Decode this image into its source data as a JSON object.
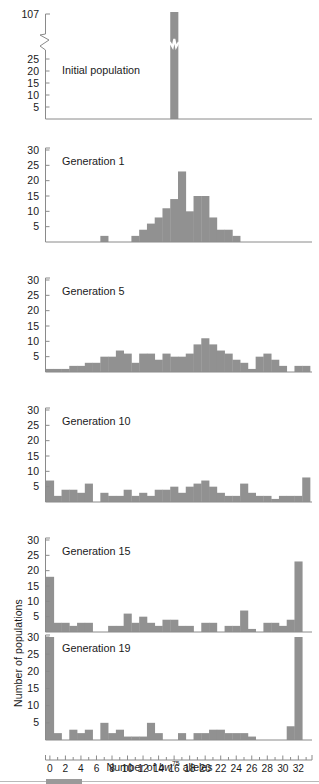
{
  "figure": {
    "y_axis_title": "Number of populations",
    "x_axis_title_parts": {
      "pre": "Number of ",
      "gene": "bw",
      "sup": "75",
      "post": " alleles"
    },
    "x_axis_title_plain": "Number of bw75 alleles",
    "bar_color": "#919191",
    "axis_color": "#8a8a8a",
    "text_color": "#1a1a1a",
    "x_tick_labels": [
      "0",
      "2",
      "4",
      "6",
      "8",
      "10",
      "12",
      "14",
      "16",
      "18",
      "20",
      "22",
      "24",
      "26",
      "28",
      "30",
      "32"
    ],
    "x_tick_values": [
      0,
      2,
      4,
      6,
      8,
      10,
      12,
      14,
      16,
      18,
      20,
      22,
      24,
      26,
      28,
      30,
      32
    ],
    "x_minor_ticks": [
      1,
      3,
      5,
      7,
      9,
      11,
      13,
      15,
      17,
      19,
      21,
      23,
      25,
      27,
      29,
      31,
      33
    ],
    "x_range": [
      0,
      33
    ]
  },
  "scrollbar": {
    "name": "horizontal-scrollbar"
  },
  "chart_data": [
    {
      "type": "bar",
      "panel_index": 0,
      "title": "Initial population",
      "xlabel": "",
      "ylabel": "",
      "ylim": [
        0,
        30
      ],
      "y_ticks": [
        5,
        10,
        15,
        20,
        25
      ],
      "y_tick_labels": [
        "5",
        "10",
        "15",
        "20",
        "25"
      ],
      "broken_axis": true,
      "broken_axis_top_label": "107",
      "broken_axis_top_value": 107,
      "grid": false,
      "categories": [
        0,
        1,
        2,
        3,
        4,
        5,
        6,
        7,
        8,
        9,
        10,
        11,
        12,
        13,
        14,
        15,
        16,
        17,
        18,
        19,
        20,
        21,
        22,
        23,
        24,
        25,
        26,
        27,
        28,
        29,
        30,
        31,
        32,
        33
      ],
      "values": [
        0,
        0,
        0,
        0,
        0,
        0,
        0,
        0,
        0,
        0,
        0,
        0,
        0,
        0,
        0,
        0,
        107,
        0,
        0,
        0,
        0,
        0,
        0,
        0,
        0,
        0,
        0,
        0,
        0,
        0,
        0,
        0,
        0,
        0
      ]
    },
    {
      "type": "bar",
      "panel_index": 1,
      "title": "Generation 1",
      "xlabel": "",
      "ylabel": "",
      "ylim": [
        0,
        30
      ],
      "y_ticks": [
        5,
        10,
        15,
        20,
        25,
        30
      ],
      "y_tick_labels": [
        "5",
        "10",
        "15",
        "20",
        "25",
        "30"
      ],
      "broken_axis": false,
      "grid": false,
      "categories": [
        0,
        1,
        2,
        3,
        4,
        5,
        6,
        7,
        8,
        9,
        10,
        11,
        12,
        13,
        14,
        15,
        16,
        17,
        18,
        19,
        20,
        21,
        22,
        23,
        24,
        25,
        26,
        27,
        28,
        29,
        30,
        31,
        32,
        33
      ],
      "values": [
        0,
        0,
        0,
        0,
        0,
        0,
        0,
        2,
        0,
        0,
        0,
        2,
        4,
        6,
        8,
        11,
        14,
        23,
        10,
        15,
        15,
        8,
        4,
        4,
        2,
        0,
        0,
        0,
        0,
        0,
        0,
        0,
        0,
        0
      ]
    },
    {
      "type": "bar",
      "panel_index": 2,
      "title": "Generation 5",
      "xlabel": "",
      "ylabel": "",
      "ylim": [
        0,
        30
      ],
      "y_ticks": [
        5,
        10,
        15,
        20,
        25,
        30
      ],
      "y_tick_labels": [
        "5",
        "10",
        "15",
        "20",
        "25",
        "30"
      ],
      "broken_axis": false,
      "grid": false,
      "categories": [
        0,
        1,
        2,
        3,
        4,
        5,
        6,
        7,
        8,
        9,
        10,
        11,
        12,
        13,
        14,
        15,
        16,
        17,
        18,
        19,
        20,
        21,
        22,
        23,
        24,
        25,
        26,
        27,
        28,
        29,
        30,
        31,
        32,
        33
      ],
      "values": [
        1,
        1,
        1,
        2,
        2,
        3,
        3,
        5,
        5,
        7,
        6,
        3,
        6,
        6,
        4,
        6,
        5,
        5,
        6,
        9,
        11,
        9,
        7,
        6,
        4,
        3,
        1,
        5,
        6,
        4,
        2,
        0,
        2,
        2
      ]
    },
    {
      "type": "bar",
      "panel_index": 3,
      "title": "Generation 10",
      "xlabel": "",
      "ylabel": "",
      "ylim": [
        0,
        30
      ],
      "y_ticks": [
        5,
        10,
        15,
        20,
        25,
        30
      ],
      "y_tick_labels": [
        "5",
        "10",
        "15",
        "20",
        "25",
        "30"
      ],
      "broken_axis": false,
      "grid": false,
      "categories": [
        0,
        1,
        2,
        3,
        4,
        5,
        6,
        7,
        8,
        9,
        10,
        11,
        12,
        13,
        14,
        15,
        16,
        17,
        18,
        19,
        20,
        21,
        22,
        23,
        24,
        25,
        26,
        27,
        28,
        29,
        30,
        31,
        32,
        33
      ],
      "values": [
        7,
        2,
        4,
        4,
        3,
        6,
        0,
        3,
        2,
        2,
        4,
        2,
        3,
        2,
        4,
        4,
        5,
        3,
        5,
        6,
        7,
        5,
        3,
        2,
        2,
        6,
        3,
        2,
        2,
        1,
        2,
        2,
        2,
        8
      ]
    },
    {
      "type": "bar",
      "panel_index": 4,
      "title": "Generation 15",
      "xlabel": "",
      "ylabel": "",
      "ylim": [
        0,
        30
      ],
      "y_ticks": [
        5,
        10,
        15,
        20,
        25,
        30
      ],
      "y_tick_labels": [
        "5",
        "10",
        "15",
        "20",
        "25",
        "30"
      ],
      "broken_axis": false,
      "grid": false,
      "categories": [
        0,
        1,
        2,
        3,
        4,
        5,
        6,
        7,
        8,
        9,
        10,
        11,
        12,
        13,
        14,
        15,
        16,
        17,
        18,
        19,
        20,
        21,
        22,
        23,
        24,
        25,
        26,
        27,
        28,
        29,
        30,
        31,
        32,
        33
      ],
      "values": [
        18,
        3,
        3,
        2,
        3,
        3,
        0,
        0,
        2,
        2,
        6,
        3,
        5,
        3,
        2,
        4,
        4,
        2,
        2,
        0,
        3,
        3,
        0,
        2,
        2,
        7,
        1,
        0,
        3,
        3,
        2,
        4,
        23,
        0
      ]
    },
    {
      "type": "bar",
      "panel_index": 5,
      "title": "Generation 19",
      "xlabel": "Number of bw75 alleles",
      "ylabel": "Number of populations",
      "ylim": [
        0,
        30
      ],
      "y_ticks": [
        5,
        10,
        15,
        20,
        25,
        30
      ],
      "y_tick_labels": [
        "5",
        "10",
        "15",
        "20",
        "25",
        "30"
      ],
      "broken_axis": false,
      "grid": false,
      "categories": [
        0,
        1,
        2,
        3,
        4,
        5,
        6,
        7,
        8,
        9,
        10,
        11,
        12,
        13,
        14,
        15,
        16,
        17,
        18,
        19,
        20,
        21,
        22,
        23,
        24,
        25,
        26,
        27,
        28,
        29,
        30,
        31,
        32,
        33
      ],
      "values": [
        30,
        2,
        0,
        3,
        2,
        3,
        0,
        5,
        2,
        3,
        1,
        1,
        1,
        5,
        2,
        0,
        0,
        2,
        0,
        2,
        2,
        3,
        3,
        2,
        2,
        2,
        1,
        0,
        0,
        0,
        0,
        4,
        30,
        0
      ]
    }
  ]
}
